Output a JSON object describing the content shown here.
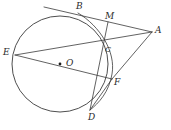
{
  "figure": {
    "kind": "euclidean-geometry-diagram",
    "width": 171,
    "height": 130,
    "background_color": "#ffffff",
    "stroke_color": "#3a3a3a",
    "label_color": "#2b2b2b",
    "points": [
      {
        "id": "A",
        "label": "A",
        "x": 152,
        "y": 32,
        "label_x": 155,
        "label_y": 26
      },
      {
        "id": "B",
        "label": "B",
        "x": 78,
        "y": 13,
        "label_x": 76,
        "label_y": 2
      },
      {
        "id": "C",
        "label": "C",
        "x": 104,
        "y": 47,
        "label_x": 105,
        "label_y": 46
      },
      {
        "id": "D",
        "label": "D",
        "x": 90,
        "y": 110,
        "label_x": 88,
        "label_y": 113
      },
      {
        "id": "E",
        "label": "E",
        "x": 15,
        "y": 55,
        "label_x": 3,
        "label_y": 48
      },
      {
        "id": "F",
        "label": "F",
        "x": 112,
        "y": 79,
        "label_x": 114,
        "label_y": 78
      },
      {
        "id": "M",
        "label": "M",
        "x": 108,
        "y": 22,
        "label_x": 105,
        "label_y": 12
      },
      {
        "id": "O",
        "label": "O",
        "x": 60,
        "y": 64,
        "label_x": 66,
        "label_y": 60
      }
    ],
    "circle": {
      "id": "main-circle",
      "center_x": 60,
      "center_y": 64,
      "radius": 48
    },
    "segments": [
      {
        "id": "tangent-at-B",
        "from": "tangent-start",
        "to": "A",
        "x1": 44,
        "y1": 7,
        "x2": 152,
        "y2": 32
      },
      {
        "id": "E-to-A",
        "from": "E",
        "to": "A",
        "x1": 15,
        "y1": 55,
        "x2": 152,
        "y2": 32
      },
      {
        "id": "E-to-F",
        "from": "E",
        "to": "F",
        "x1": 15,
        "y1": 55,
        "x2": 112,
        "y2": 79
      },
      {
        "id": "A-to-F",
        "from": "A",
        "to": "F",
        "x1": 152,
        "y1": 32,
        "x2": 112,
        "y2": 79
      },
      {
        "id": "M-to-D",
        "from": "M",
        "to": "D",
        "x1": 108,
        "y1": 22,
        "x2": 90,
        "y2": 110
      },
      {
        "id": "D-to-F",
        "from": "D",
        "to": "F",
        "x1": 90,
        "y1": 110,
        "x2": 112,
        "y2": 79
      }
    ],
    "arcs": [
      {
        "id": "arc-B-C-D",
        "description": "small arc through B, C, F toward D",
        "path": "M 78 13 Q 118 48 90 110"
      }
    ],
    "center_marker": {
      "id": "center-dot",
      "x": 60,
      "y": 64,
      "radius": 1.4
    }
  }
}
